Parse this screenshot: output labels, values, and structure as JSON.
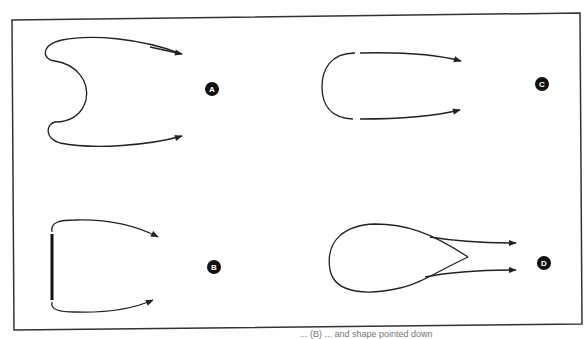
{
  "figure": {
    "panels": [
      {
        "id": "A",
        "label": "A",
        "description": "curved loop with concave inward center, two arrows pointing right"
      },
      {
        "id": "B",
        "label": "B",
        "description": "bracket with thick vertical bar, two arrows pointing right"
      },
      {
        "id": "C",
        "label": "C",
        "description": "U-shaped loop with gaps, two arrows pointing right"
      },
      {
        "id": "D",
        "label": "D",
        "description": "teardrop loop with pointed tip, two arrows pointing right"
      }
    ],
    "colors": {
      "stroke": "#222222",
      "label_bg": "#111111",
      "label_fg": "#ffffff",
      "frame": "#333333"
    }
  },
  "caption": {
    "text": "... (B) ... and shape pointed down"
  }
}
